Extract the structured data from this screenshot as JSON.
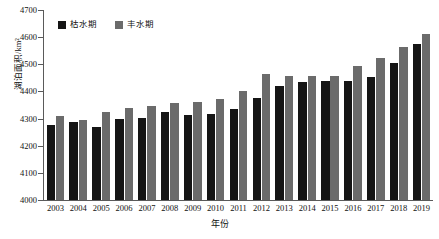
{
  "chart_data": {
    "type": "bar",
    "title": "",
    "xlabel": "年份",
    "ylabel": "湖泊面积/km²",
    "ylim": [
      4000,
      4700
    ],
    "ytick_step": 100,
    "yticks": [
      4000,
      4100,
      4200,
      4300,
      4400,
      4500,
      4600,
      4700
    ],
    "grid": false,
    "legend_position": "top-left",
    "categories": [
      "2003",
      "2004",
      "2005",
      "2006",
      "2007",
      "2008",
      "2009",
      "2010",
      "2011",
      "2012",
      "2013",
      "2014",
      "2015",
      "2016",
      "2017",
      "2018",
      "2019"
    ],
    "series": [
      {
        "name": "枯水期",
        "color": "#151515",
        "values": [
          4277,
          4288,
          4270,
          4300,
          4304,
          4324,
          4315,
          4318,
          4336,
          4375,
          4421,
          4435,
          4439,
          4440,
          4453,
          4504,
          4573
        ]
      },
      {
        "name": "丰水期",
        "color": "#6b6b6b",
        "values": [
          4309,
          4295,
          4326,
          4340,
          4348,
          4356,
          4360,
          4371,
          4401,
          4464,
          4456,
          4456,
          4458,
          4495,
          4524,
          4565,
          4611
        ]
      }
    ]
  },
  "legend": {
    "items": [
      {
        "label": "枯水期",
        "color": "#151515"
      },
      {
        "label": "丰水期",
        "color": "#6b6b6b"
      }
    ]
  },
  "axes": {
    "y_title": "湖泊面积/km²",
    "x_title": "年份"
  }
}
